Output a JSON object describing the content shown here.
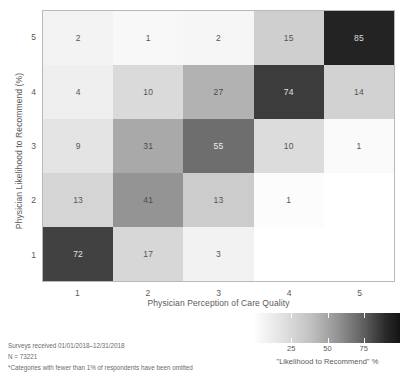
{
  "chart_data": {
    "type": "heatmap",
    "title": "",
    "xlabel": "Physician Perception of Care Quality",
    "ylabel": "Physician Likelihood to Recommend (%)",
    "x_categories": [
      "1",
      "2",
      "3",
      "4",
      "5"
    ],
    "y_categories": [
      "1",
      "2",
      "3",
      "4",
      "5"
    ],
    "y_order_top_to_bottom": [
      "5",
      "4",
      "3",
      "2",
      "1"
    ],
    "grid": false,
    "colorbar": {
      "title": "\"Likelihood to Recommend\" %",
      "tick_values": [
        25,
        50,
        75
      ],
      "tick_labels": [
        "25",
        "50",
        "75"
      ],
      "range": [
        0,
        100
      ],
      "low_color": "#fdfdfd",
      "high_color": "#141414",
      "position": "bottom-right"
    },
    "cells": [
      {
        "y": "5",
        "x": "1",
        "value": 2,
        "label": "2",
        "fill": "#f3f3f3",
        "text_color": "#555555"
      },
      {
        "y": "5",
        "x": "2",
        "value": 1,
        "label": "1",
        "fill": "#f8f8f8",
        "text_color": "#555555"
      },
      {
        "y": "5",
        "x": "3",
        "value": 2,
        "label": "2",
        "fill": "#f6f6f6",
        "text_color": "#555555"
      },
      {
        "y": "5",
        "x": "4",
        "value": 15,
        "label": "15",
        "fill": "#cfcfcf",
        "text_color": "#555555"
      },
      {
        "y": "5",
        "x": "5",
        "value": 85,
        "label": "85",
        "fill": "#232323",
        "text_color": "#dcdcdc"
      },
      {
        "y": "4",
        "x": "1",
        "value": 4,
        "label": "4",
        "fill": "#efefef",
        "text_color": "#555555"
      },
      {
        "y": "4",
        "x": "2",
        "value": 10,
        "label": "10",
        "fill": "#dadada",
        "text_color": "#555555"
      },
      {
        "y": "4",
        "x": "3",
        "value": 27,
        "label": "27",
        "fill": "#b2b2b2",
        "text_color": "#4a4a4a"
      },
      {
        "y": "4",
        "x": "4",
        "value": 74,
        "label": "74",
        "fill": "#3c3c3c",
        "text_color": "#e2e2e2"
      },
      {
        "y": "4",
        "x": "5",
        "value": 14,
        "label": "14",
        "fill": "#d2d2d2",
        "text_color": "#555555"
      },
      {
        "y": "3",
        "x": "1",
        "value": 9,
        "label": "9",
        "fill": "#e4e4e4",
        "text_color": "#555555"
      },
      {
        "y": "3",
        "x": "2",
        "value": 31,
        "label": "31",
        "fill": "#a9a9a9",
        "text_color": "#4a4a4a"
      },
      {
        "y": "3",
        "x": "3",
        "value": 55,
        "label": "55",
        "fill": "#6e6e6e",
        "text_color": "#ededed"
      },
      {
        "y": "3",
        "x": "4",
        "value": 10,
        "label": "10",
        "fill": "#dcdcdc",
        "text_color": "#555555"
      },
      {
        "y": "3",
        "x": "5",
        "value": 1,
        "label": "1",
        "fill": "#fafafa",
        "text_color": "#555555"
      },
      {
        "y": "2",
        "x": "1",
        "value": 13,
        "label": "13",
        "fill": "#d5d5d5",
        "text_color": "#555555"
      },
      {
        "y": "2",
        "x": "2",
        "value": 41,
        "label": "41",
        "fill": "#949494",
        "text_color": "#4a4a4a"
      },
      {
        "y": "2",
        "x": "3",
        "value": 13,
        "label": "13",
        "fill": "#cccccc",
        "text_color": "#555555"
      },
      {
        "y": "2",
        "x": "4",
        "value": 1,
        "label": "1",
        "fill": "#fcfcfc",
        "text_color": "#555555"
      },
      {
        "y": "2",
        "x": "5",
        "value": null,
        "label": "",
        "fill": "#ffffff",
        "text_color": "#555555"
      },
      {
        "y": "1",
        "x": "1",
        "value": 72,
        "label": "72",
        "fill": "#414141",
        "text_color": "#e2e2e2"
      },
      {
        "y": "1",
        "x": "2",
        "value": 17,
        "label": "17",
        "fill": "#d7d7d7",
        "text_color": "#555555"
      },
      {
        "y": "1",
        "x": "3",
        "value": 3,
        "label": "3",
        "fill": "#f2f2f2",
        "text_color": "#555555"
      },
      {
        "y": "1",
        "x": "4",
        "value": null,
        "label": "",
        "fill": "#ffffff",
        "text_color": "#555555"
      },
      {
        "y": "1",
        "x": "5",
        "value": null,
        "label": "",
        "fill": "#ffffff",
        "text_color": "#555555"
      }
    ]
  },
  "footnotes": [
    "Surveys received 01/01/2018–12/31/2018",
    "N = 73221",
    "*Categories with fewer than 1% of respondents have been omitted"
  ]
}
